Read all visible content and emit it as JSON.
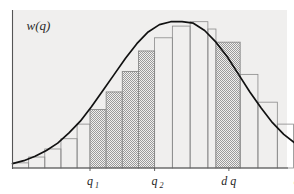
{
  "figure": {
    "title": "",
    "ylabel": "w(q)",
    "xlabel": "q",
    "background_color": "#f0efee",
    "axis_color": "#555555",
    "curve_color": "#111111",
    "bar_stroke_color": "#8a8a8a",
    "bar_fill_color": "#9b9b9b",
    "tick_labels": {
      "q1_base": "q",
      "q1_sub": "1",
      "q2_base": "q",
      "q2_sub": "2",
      "dq": "d q",
      "q_axis": "q"
    }
  },
  "chart_data": {
    "type": "bar",
    "title": "",
    "xlabel": "q",
    "ylabel": "w(q)",
    "grid": false,
    "legend": null,
    "xlim": [
      0,
      17
    ],
    "ylim": [
      0,
      1.08
    ],
    "annotations": [
      {
        "label": "q",
        "sub": "1",
        "x": 4.8,
        "kind": "x-tick"
      },
      {
        "label": "q",
        "sub": "2",
        "x": 8.8,
        "kind": "x-tick"
      },
      {
        "label": "d q",
        "x": 13.4,
        "kind": "x-tick"
      },
      {
        "label": "q",
        "x": 17.6,
        "kind": "axis-name"
      }
    ],
    "shaded_intervals": [
      {
        "name": "q1-to-q2",
        "x_start": 4.8,
        "x_end": 8.8
      },
      {
        "name": "dq-strip",
        "x_start": 12.6,
        "x_end": 14.1
      }
    ],
    "bar_edges": [
      0.0,
      1.0,
      2.0,
      3.0,
      4.0,
      4.8,
      5.8,
      6.8,
      7.8,
      8.8,
      9.9,
      11.0,
      12.1,
      12.6,
      14.1,
      15.2,
      16.4,
      17.4
    ],
    "bar_values": [
      0.035,
      0.075,
      0.13,
      0.2,
      0.3,
      0.4,
      0.52,
      0.66,
      0.8,
      0.89,
      0.97,
      1.0,
      0.95,
      0.86,
      0.64,
      0.45,
      0.3
    ],
    "curve": {
      "name": "w(q)",
      "type": "line",
      "mean": 11.2,
      "peak_value": 1.0,
      "x": [
        0.0,
        0.7,
        1.4,
        2.1,
        2.8,
        3.5,
        4.2,
        4.9,
        5.6,
        6.3,
        7.0,
        7.7,
        8.4,
        9.1,
        9.8,
        10.5,
        11.2,
        11.9,
        12.6,
        13.3,
        14.0,
        14.7,
        15.4,
        16.1,
        16.8,
        17.5
      ],
      "y": [
        0.03,
        0.05,
        0.08,
        0.12,
        0.17,
        0.24,
        0.32,
        0.42,
        0.53,
        0.64,
        0.75,
        0.85,
        0.93,
        0.98,
        1.0,
        1.0,
        0.99,
        0.94,
        0.86,
        0.76,
        0.64,
        0.52,
        0.41,
        0.31,
        0.23,
        0.17
      ]
    }
  }
}
